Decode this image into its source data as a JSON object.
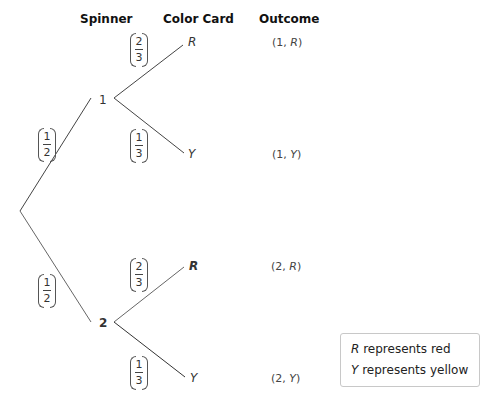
{
  "headers": {
    "spinner": "Spinner",
    "color_card": "Color Card",
    "outcome": "Outcome"
  },
  "nodes": {
    "spinner_1": "1",
    "spinner_2": "2"
  },
  "leaves": {
    "n1_r": "R",
    "n1_y": "Y",
    "n2_r": "R",
    "n2_y": "Y"
  },
  "probabilities": {
    "root_to_1": {
      "num": "1",
      "den": "2"
    },
    "root_to_2": {
      "num": "1",
      "den": "2"
    },
    "n1_to_r": {
      "num": "2",
      "den": "3"
    },
    "n1_to_y": {
      "num": "1",
      "den": "3"
    },
    "n2_to_r": {
      "num": "2",
      "den": "3"
    },
    "n2_to_y": {
      "num": "1",
      "den": "3"
    }
  },
  "outcomes": [
    {
      "spinner": "1",
      "color": "R"
    },
    {
      "spinner": "1",
      "color": "Y"
    },
    {
      "spinner": "2",
      "color": "R"
    },
    {
      "spinner": "2",
      "color": "Y"
    }
  ],
  "legend": {
    "line1_symbol": "R",
    "line1_text": " represents red",
    "line2_symbol": "Y",
    "line2_text": " represents yellow"
  },
  "colors": {
    "line": "#444444",
    "legend_border": "#c8c8c8"
  }
}
